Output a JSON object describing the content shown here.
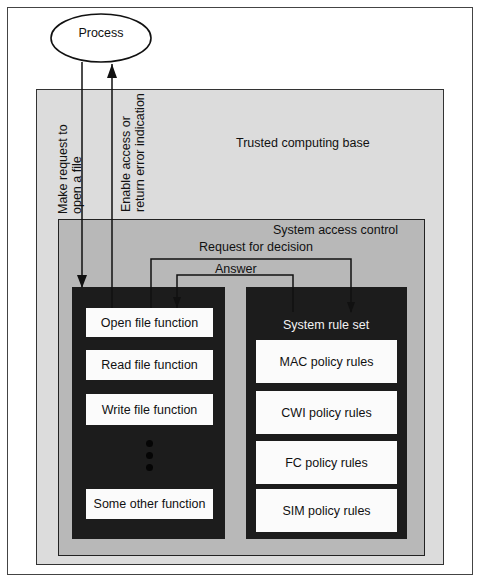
{
  "process": {
    "label": "Process"
  },
  "arrows": {
    "request_open": {
      "line1": "Make request to",
      "line2": "open a file"
    },
    "enable_access": {
      "line1": "Enable access or",
      "line2": "return error indication"
    },
    "request_decision": "Request for decision",
    "answer": "Answer"
  },
  "trusted_computing_base": {
    "label": "Trusted computing base"
  },
  "system_access_control": {
    "label": "System access control",
    "functions": [
      {
        "label": "Open file function"
      },
      {
        "label": "Read file function"
      },
      {
        "label": "Write file function"
      },
      {
        "label": "Some other function"
      }
    ],
    "ellipsis": "more functions",
    "rule_set": {
      "label": "System rule set",
      "rules": [
        {
          "label": "MAC policy rules"
        },
        {
          "label": "CWI policy rules"
        },
        {
          "label": "FC policy rules"
        },
        {
          "label": "SIM policy rules"
        }
      ]
    }
  },
  "colors": {
    "tcb_fill": "#dcdcdc",
    "sac_fill": "#b8b8b8",
    "dark_fill": "#1c1c1c",
    "box_fill": "#fbfbfb"
  }
}
